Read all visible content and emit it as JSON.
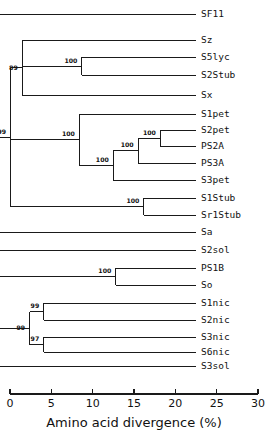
{
  "figure": {
    "kind": "phylogenetic-tree",
    "axis_title": "Amino acid divergence (%)",
    "axis": {
      "min": 0,
      "max": 30,
      "ticks": [
        0,
        5,
        10,
        15,
        20,
        25,
        30
      ],
      "tick_labels": [
        "0",
        "5",
        "10",
        "15",
        "20",
        "25",
        "30"
      ],
      "direction": "left-to-right-increasing-divergence"
    }
  },
  "chart_data": {
    "type": "tree",
    "title": "",
    "xlabel": "Amino acid divergence (%)",
    "ylabel": "",
    "xlim": [
      0,
      30
    ],
    "grid": false,
    "legend": "none",
    "tips": [
      {
        "name": "SF11",
        "divergence": 0.0,
        "row": 0
      },
      {
        "name": "Sz",
        "divergence": 0.0,
        "row": 1
      },
      {
        "name": "S5lyc",
        "divergence": 0.0,
        "row": 2
      },
      {
        "name": "S2Stub",
        "divergence": 0.0,
        "row": 3
      },
      {
        "name": "Sx",
        "divergence": 0.0,
        "row": 4
      },
      {
        "name": "S1pet",
        "divergence": 0.0,
        "row": 5
      },
      {
        "name": "S2pet",
        "divergence": 0.0,
        "row": 6
      },
      {
        "name": "PS2A",
        "divergence": 0.0,
        "row": 7
      },
      {
        "name": "PS3A",
        "divergence": 0.0,
        "row": 8
      },
      {
        "name": "S3pet",
        "divergence": 0.0,
        "row": 9
      },
      {
        "name": "S1Stub",
        "divergence": 0.0,
        "row": 10
      },
      {
        "name": "Sr1Stub",
        "divergence": 0.0,
        "row": 11
      },
      {
        "name": "Sa",
        "divergence": 0.0,
        "row": 12
      },
      {
        "name": "S2sol",
        "divergence": 0.0,
        "row": 13
      },
      {
        "name": "PS1B",
        "divergence": 0.0,
        "row": 14
      },
      {
        "name": "So",
        "divergence": 0.0,
        "row": 15
      },
      {
        "name": "S1nic",
        "divergence": 0.0,
        "row": 16
      },
      {
        "name": "S2nic",
        "divergence": 0.0,
        "row": 17
      },
      {
        "name": "S3nic",
        "divergence": 0.0,
        "row": 18
      },
      {
        "name": "S6nic",
        "divergence": 0.0,
        "row": 19
      },
      {
        "name": "S3sol",
        "divergence": 0.0,
        "row": 20
      }
    ],
    "bootstrap_nodes": [
      {
        "id": "root",
        "label": "99",
        "divergence": 26.5
      },
      {
        "id": "n-upper",
        "label": "100",
        "divergence": 24.2
      },
      {
        "id": "n-sz-clade",
        "label": "99",
        "divergence": 22.4
      },
      {
        "id": "n-89",
        "label": "89",
        "divergence": 21.0
      },
      {
        "id": "n-lyc-stub",
        "label": "100",
        "divergence": 13.8
      },
      {
        "id": "n-pet-top",
        "label": "100",
        "divergence": 14.1
      },
      {
        "id": "n-pet-mid",
        "label": "100",
        "divergence": 10.0
      },
      {
        "id": "n-pet-in",
        "label": "100",
        "divergence": 7.0
      },
      {
        "id": "n-pet-pair",
        "label": "100",
        "divergence": 4.3
      },
      {
        "id": "n-stub-pair",
        "label": "100",
        "divergence": 6.3
      },
      {
        "id": "n-59",
        "label": "59",
        "divergence": 25.5
      },
      {
        "id": "n-83",
        "label": "83",
        "divergence": 23.9
      },
      {
        "id": "n-ps1b-so",
        "label": "100",
        "divergence": 9.7
      },
      {
        "id": "n-94",
        "label": "94",
        "divergence": 24.3
      },
      {
        "id": "n-99-nic",
        "label": "99",
        "divergence": 20.1
      },
      {
        "id": "n-99-nic-up",
        "label": "99",
        "divergence": 18.4
      },
      {
        "id": "n-97-nic",
        "label": "97",
        "divergence": 18.4
      }
    ]
  },
  "geometry": {
    "tip_x_px": 196,
    "label_x_px": 201,
    "rows_y_px": [
      14,
      40,
      57,
      75,
      95,
      114,
      130,
      146,
      163,
      180,
      198,
      215,
      232,
      250,
      268,
      285,
      303,
      320,
      337,
      352,
      366
    ],
    "axis_y_px": 394,
    "axis_x0_px": 10,
    "axis_x1_px": 258
  },
  "colors": {
    "ink": "#1a1a1a",
    "background": "#ffffff"
  }
}
